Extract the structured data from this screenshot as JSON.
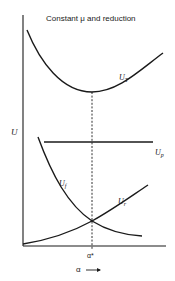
{
  "figure": {
    "title": "Constant μ and reduction",
    "y_axis_label": "U",
    "x_axis_label": "α",
    "x_axis_arrow": "⟶",
    "optimum_label": "α*",
    "curves": [
      {
        "id": "total",
        "symbol": "U",
        "subscript": "T",
        "shape": "U-shaped, minimum at α*"
      },
      {
        "id": "plastic",
        "symbol": "U",
        "subscript": "p",
        "shape": "constant horizontal line"
      },
      {
        "id": "friction",
        "symbol": "U",
        "subscript": "f",
        "shape": "decreasing with α"
      },
      {
        "id": "redundant",
        "symbol": "U",
        "subscript": "r",
        "shape": "increasing with α"
      }
    ],
    "intersection_note": "U_f and U_r intersect at α*; U_T minimum at α*",
    "line_color": "#1a1a1a"
  }
}
